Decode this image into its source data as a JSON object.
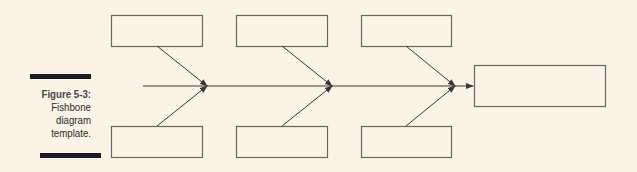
{
  "figure": {
    "label": "Figure 5-3:",
    "caption_lines": [
      "Fishbone",
      "diagram",
      "template."
    ]
  },
  "diagram": {
    "type": "fishbone",
    "cause_boxes_top": 3,
    "cause_boxes_bottom": 3,
    "effect_box": 1,
    "line_color": "#3a3838",
    "background": "#fbf3e6"
  }
}
